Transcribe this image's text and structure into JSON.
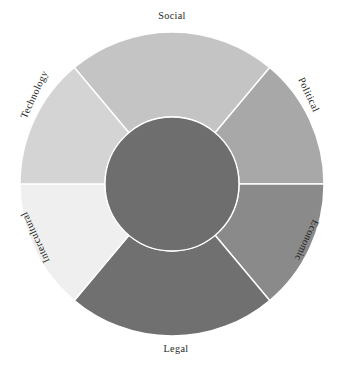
{
  "figure": {
    "name": "pestle-intercultural-wheel",
    "background": "#ffffff",
    "center_x": 172,
    "center_y": 184,
    "outer_radius": 152,
    "inner_radius": 67,
    "hub_color": "#6e6e6e",
    "divider_color": "#ffffff",
    "label_color": "#231f20"
  },
  "chart_data": {
    "type": "pie",
    "title": "",
    "subtitle": "",
    "xlabel": "",
    "ylabel": "",
    "grid": false,
    "legend_position": "none",
    "shape": "donut",
    "inner_hole_ratio": 0.44,
    "start_angle_deg": -40,
    "direction": "clockwise",
    "categories": [
      "Social",
      "Political",
      "Economic",
      "Legal",
      "Intercultural",
      "Technology"
    ],
    "values": [
      80,
      50,
      50,
      80,
      50,
      50
    ],
    "slice_angles_deg": [
      80,
      50,
      50,
      80,
      50,
      50
    ],
    "annotations": [],
    "series": [
      {
        "name": "segments",
        "values": [
          80,
          50,
          50,
          80,
          50,
          50
        ]
      }
    ],
    "segments": [
      {
        "label": "Social",
        "color": "#c4c4c4",
        "start_deg": -40,
        "end_deg": 40,
        "sweep_deg": 80,
        "label_orientation": "horizontal",
        "label_placement": "outside-top",
        "label_x": 172,
        "label_y": 17,
        "label_rotation_deg": 0
      },
      {
        "label": "Political",
        "color": "#a8a8a8",
        "start_deg": 40,
        "end_deg": 90,
        "sweep_deg": 50,
        "label_orientation": "rotated",
        "label_placement": "outside-upper-right",
        "label_x": 308,
        "label_y": 95,
        "label_rotation_deg": 65
      },
      {
        "label": "Economic",
        "color": "#8a8a8a",
        "start_deg": 90,
        "end_deg": 140,
        "sweep_deg": 50,
        "label_orientation": "rotated",
        "label_placement": "outside-lower-right",
        "label_x": 306,
        "label_y": 240,
        "label_rotation_deg": 115
      },
      {
        "label": "Legal",
        "color": "#707070",
        "start_deg": 140,
        "end_deg": 220,
        "sweep_deg": 80,
        "label_orientation": "horizontal",
        "label_placement": "outside-bottom",
        "label_x": 176,
        "label_y": 350,
        "label_rotation_deg": 0
      },
      {
        "label": "Intercultural",
        "color": "#efefef",
        "start_deg": 220,
        "end_deg": 270,
        "sweep_deg": 50,
        "label_orientation": "rotated",
        "label_placement": "outside-lower-left",
        "label_x": 36,
        "label_y": 237,
        "label_rotation_deg": -115
      },
      {
        "label": "Technology",
        "color": "#d4d4d4",
        "start_deg": 270,
        "end_deg": 320,
        "sweep_deg": 50,
        "label_orientation": "rotated",
        "label_placement": "outside-upper-left",
        "label_x": 35,
        "label_y": 95,
        "label_rotation_deg": -65
      }
    ],
    "hub": {
      "label": "",
      "color": "#6e6e6e"
    }
  },
  "labels": {
    "social": "Social",
    "political": "Political",
    "economic": "Economic",
    "legal": "Legal",
    "intercultural": "Intercultural",
    "technology": "Technology"
  }
}
